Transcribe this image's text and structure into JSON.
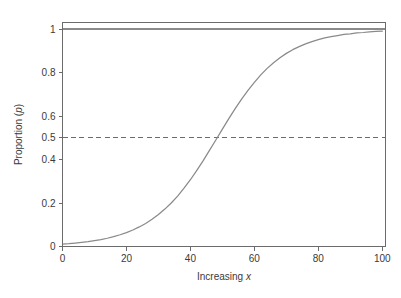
{
  "figure": {
    "background_color": "#ffffff",
    "width": 401,
    "height": 298
  },
  "chart_data": {
    "type": "line",
    "title": "",
    "subtitle": "",
    "xlabel_prefix": "Increasing",
    "xlabel_symbol": "x",
    "ylabel_prefix": "Proportion",
    "ylabel_symbol": "p",
    "ylabel_open_paren": "(",
    "ylabel_close_paren": ")",
    "xlim": [
      0,
      101
    ],
    "ylim": [
      0,
      1.03
    ],
    "grid": false,
    "legend": "none",
    "xticks": [
      0,
      20,
      40,
      60,
      80,
      100
    ],
    "xtick_labels": [
      "0",
      "20",
      "40",
      "60",
      "80",
      "100"
    ],
    "yticks": [
      0,
      0.2,
      0.4,
      0.5,
      0.6,
      0.8,
      1
    ],
    "ytick_labels": [
      "0",
      "0.2",
      "0.4",
      "0.5",
      "0.6",
      "0.8",
      "1"
    ],
    "series": [
      {
        "name": "logistic-curve",
        "style": "solid",
        "color": "#8a8a8a",
        "midpoint_x": 50,
        "scale": 11,
        "x": [
          0,
          2,
          4,
          6,
          8,
          10,
          12,
          14,
          16,
          18,
          20,
          22,
          24,
          26,
          28,
          30,
          32,
          34,
          36,
          38,
          40,
          42,
          44,
          46,
          48,
          50,
          52,
          54,
          56,
          58,
          60,
          62,
          64,
          66,
          68,
          70,
          72,
          74,
          76,
          78,
          80,
          82,
          84,
          86,
          88,
          90,
          92,
          94,
          96,
          98,
          100
        ],
        "values": [
          0.011,
          0.013,
          0.016,
          0.019,
          0.022,
          0.027,
          0.032,
          0.038,
          0.045,
          0.054,
          0.064,
          0.076,
          0.09,
          0.106,
          0.125,
          0.147,
          0.172,
          0.2,
          0.232,
          0.268,
          0.307,
          0.35,
          0.395,
          0.443,
          0.491,
          0.54,
          0.588,
          0.634,
          0.678,
          0.718,
          0.755,
          0.789,
          0.819,
          0.845,
          0.868,
          0.888,
          0.905,
          0.919,
          0.932,
          0.942,
          0.951,
          0.959,
          0.965,
          0.97,
          0.975,
          0.978,
          0.982,
          0.984,
          0.987,
          0.989,
          0.99
        ]
      }
    ],
    "reference_lines": [
      {
        "name": "upper-asymptote",
        "orientation": "horizontal",
        "value": 1,
        "style": "solid",
        "color": "#8a8a8a"
      },
      {
        "name": "half-proportion",
        "orientation": "horizontal",
        "value": 0.5,
        "style": "dashed",
        "color": "#6b6b6b"
      },
      {
        "name": "lower-asymptote",
        "orientation": "horizontal",
        "value": 0,
        "style": "solid",
        "color": "#8a8a8a"
      }
    ],
    "frame_color": "#6b6b6b",
    "tick_color": "#6b6b6b",
    "text_color": "#3a3a3a"
  }
}
